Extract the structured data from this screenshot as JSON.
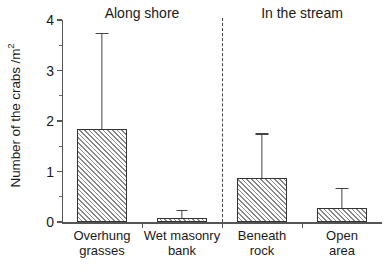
{
  "chart_data": {
    "type": "bar",
    "title": "",
    "xlabel": "",
    "ylabel": "Number of the crabs /m²",
    "ylabel_main": "Number of the crabs /m",
    "ylabel_sup": "2",
    "ylim": [
      0,
      4
    ],
    "ytick_labels": [
      "0",
      "1",
      "2",
      "3",
      "4"
    ],
    "ytick_values": [
      0,
      1,
      2,
      3,
      4
    ],
    "yminor_values": [
      0.5,
      1.5,
      2.5,
      3.5
    ],
    "grid": false,
    "legend": "none",
    "categories": [
      "Overhung grasses",
      "Wet masonry bank",
      "Beneath rock",
      "Open area"
    ],
    "category_lines": [
      [
        "Overhung",
        "grasses"
      ],
      [
        "Wet masonry",
        "bank"
      ],
      [
        "Beneath",
        "rock"
      ],
      [
        "Open",
        "area"
      ]
    ],
    "values": [
      1.85,
      0.08,
      0.87,
      0.28
    ],
    "errors_upper": [
      3.75,
      0.24,
      1.76,
      0.68
    ],
    "groups": [
      {
        "label": "Along shore",
        "members": [
          0,
          1
        ]
      },
      {
        "label": "In the stream",
        "members": [
          2,
          3
        ]
      }
    ],
    "divider": {
      "style": "dashed",
      "position_between": [
        1,
        2
      ]
    },
    "bar_style": {
      "fill": "diagonal-hatch",
      "hatch_angle_deg": 45,
      "edge_color": "#333333",
      "hatch_color": "#888888",
      "background_color": "#ffffff"
    },
    "axis_color": "#555555"
  },
  "labels": {
    "group_along_shore": "Along shore",
    "group_in_the_stream": "In the stream"
  }
}
